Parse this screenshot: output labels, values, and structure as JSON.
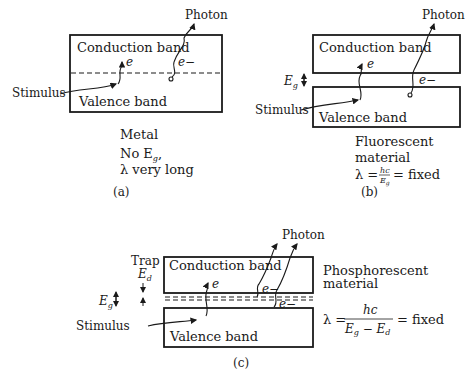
{
  "panels": {
    "a": {
      "caption": "(a)",
      "conduction_label": "Conduction band",
      "valence_label": "Valence band",
      "photon_label": "Photon",
      "stimulus_label": "Stimulus",
      "electron_label": "e",
      "electron_minus_label": "e−",
      "material": "Metal",
      "note_line1": "No E",
      "note_line1_sub": "g",
      "note_line1_end": ",",
      "note_line2": "λ very long"
    },
    "b": {
      "caption": "(b)",
      "conduction_label": "Conduction band",
      "valence_label": "Valence band",
      "photon_label": "Photon",
      "stimulus_label": "Stimulus",
      "electron_label": "e",
      "electron_minus_label": "e−",
      "gap_label": "E",
      "gap_sub": "g",
      "material_line1": "Fluorescent",
      "material_line2": "material",
      "formula_lhs": "λ =",
      "formula_num": "hc",
      "formula_den": "E",
      "formula_den_sub": "g",
      "formula_rhs": "= fixed"
    },
    "c": {
      "caption": "(c)",
      "conduction_label": "Conduction band",
      "valence_label": "Valence band",
      "photon_label": "Photon",
      "stimulus_label": "Stimulus",
      "electron_label": "e",
      "electron_minus_label": "e−",
      "trap_label": "Trap",
      "trap_energy": "E",
      "trap_energy_sub": "d",
      "gap_label": "E",
      "gap_sub": "g",
      "material_line1": "Phosphorescent",
      "material_line2": "material",
      "formula_lhs": "λ =",
      "formula_num": "hc",
      "formula_den": "E",
      "formula_den_sub1": "g",
      "formula_den_mid": " − E",
      "formula_den_sub2": "d",
      "formula_rhs": "= fixed"
    }
  }
}
